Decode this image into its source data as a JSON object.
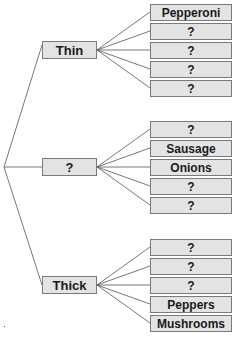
{
  "diagram": {
    "type": "tree-diagram",
    "colors": {
      "box_fill": "#e3e3e3",
      "box_border": "#7a7a7a",
      "line": "#555555",
      "text": "#1a1a1a"
    },
    "branches": [
      {
        "label": "Thin",
        "leaves": [
          "Pepperoni",
          "?",
          "?",
          "?",
          "?"
        ]
      },
      {
        "label": "?",
        "leaves": [
          "?",
          "Sausage",
          "Onions",
          "?",
          "?"
        ]
      },
      {
        "label": "Thick",
        "leaves": [
          "?",
          "?",
          "?",
          "Peppers",
          "Mushrooms"
        ]
      }
    ]
  }
}
